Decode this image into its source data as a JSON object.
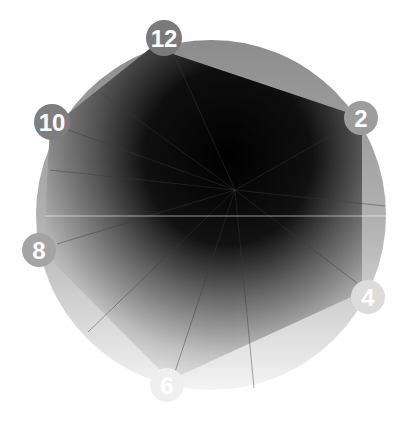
{
  "figure": {
    "colors": {
      "background": "#ffffff",
      "circle_top": "#8c8c8c",
      "circle_bottom": "#f2f2f2",
      "hexagon_dark": "#050505",
      "hexagon_light": "#f4f4f4",
      "badge_dark": "#7a7a7a",
      "badge_light": "#ebebeb",
      "badge_text": "#ffffff"
    },
    "circle": {
      "cx": 211,
      "cy": 215,
      "r": 175
    },
    "horizon_line_y": 216,
    "badges": [
      {
        "label": "12",
        "cx": 164,
        "cy": 38,
        "r": 18
      },
      {
        "label": "2",
        "cx": 361,
        "cy": 118,
        "r": 17
      },
      {
        "label": "4",
        "cx": 368,
        "cy": 297,
        "r": 17
      },
      {
        "label": "6",
        "cx": 167,
        "cy": 385,
        "r": 17
      },
      {
        "label": "8",
        "cx": 39,
        "cy": 250,
        "r": 17
      },
      {
        "label": "10",
        "cx": 52,
        "cy": 122,
        "r": 18
      }
    ]
  }
}
